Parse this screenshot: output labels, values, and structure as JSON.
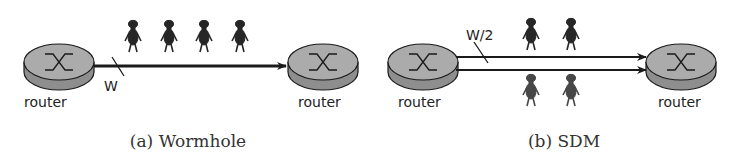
{
  "panels": [
    {
      "id": "a",
      "caption": "(a) Wormhole",
      "left_router_label": "router",
      "right_router_label": "router",
      "link_label": "W",
      "links": 1,
      "flits_above": 4,
      "flits_below": 0
    },
    {
      "id": "b",
      "caption": "(b) SDM",
      "left_router_label": "router",
      "right_router_label": "router",
      "link_label": "W/2",
      "links": 2,
      "flits_above": 2,
      "flits_below": 2
    }
  ],
  "icons": {
    "router": "router-icon",
    "flit": "person-figure-icon",
    "arrow": "arrow-right-icon"
  },
  "colors": {
    "router_fill": "#a8a8a8",
    "router_side": "#8c8c8c",
    "stroke": "#1a1a1a",
    "flit_dark": "#2a2a2a",
    "flit_light": "#4a4a4a"
  }
}
